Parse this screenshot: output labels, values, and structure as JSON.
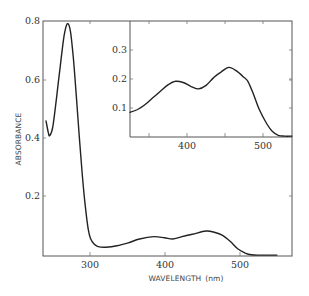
{
  "chart_data": [
    {
      "id": "main",
      "type": "line",
      "title": "",
      "xlabel": "WAVELENGTH (nm)",
      "ylabel": "ABSORBANCE",
      "xlim": [
        237,
        567
      ],
      "ylim": [
        0.0,
        0.8
      ],
      "xticks": [
        300,
        400,
        500
      ],
      "yticks": [
        0.2,
        0.4,
        0.6,
        0.8
      ],
      "ytick_labels": [
        "0.2",
        "0.4",
        "0.6",
        "0.8"
      ],
      "xtick_labels": [
        "300",
        "400",
        "500"
      ],
      "grid": false,
      "series": [
        {
          "name": "absorption spectrum",
          "x": [
            241,
            244,
            246,
            250,
            255,
            260,
            265,
            269,
            273,
            277,
            281,
            285,
            289,
            293,
            297,
            300,
            305,
            310,
            320,
            335,
            350,
            365,
            384,
            398,
            409,
            420,
            435,
            453,
            465,
            475,
            485,
            495,
            505,
            513,
            525,
            547
          ],
          "y": [
            0.46,
            0.42,
            0.41,
            0.44,
            0.54,
            0.65,
            0.75,
            0.79,
            0.77,
            0.68,
            0.55,
            0.41,
            0.28,
            0.17,
            0.09,
            0.06,
            0.04,
            0.032,
            0.03,
            0.035,
            0.045,
            0.058,
            0.066,
            0.062,
            0.058,
            0.065,
            0.074,
            0.085,
            0.08,
            0.07,
            0.05,
            0.025,
            0.01,
            0.004,
            0.003,
            0.003
          ]
        }
      ]
    },
    {
      "id": "inset",
      "type": "line",
      "title": "",
      "xlabel": "",
      "ylabel": "",
      "xlim": [
        325,
        538
      ],
      "ylim": [
        0.0,
        0.4
      ],
      "xticks": [
        350,
        400,
        450,
        500
      ],
      "xtick_labels": [
        "",
        "400",
        "",
        "500"
      ],
      "yticks": [
        0.1,
        0.2,
        0.3
      ],
      "ytick_labels": [
        "0.1",
        "0.2",
        "0.3"
      ],
      "grid": false,
      "series": [
        {
          "name": "absorption spectrum (expanded)",
          "x": [
            325,
            335,
            345,
            355,
            365,
            375,
            385,
            395,
            405,
            415,
            425,
            435,
            445,
            455,
            465,
            475,
            480,
            487,
            495,
            505,
            512,
            520,
            528,
            538
          ],
          "y": [
            0.085,
            0.095,
            0.112,
            0.135,
            0.158,
            0.18,
            0.192,
            0.188,
            0.175,
            0.166,
            0.178,
            0.205,
            0.225,
            0.24,
            0.228,
            0.205,
            0.192,
            0.15,
            0.095,
            0.045,
            0.02,
            0.006,
            0.003,
            0.003
          ]
        }
      ]
    }
  ],
  "labels": {
    "ylabel": "ABSORBANCE",
    "xlabel": "WAVELENGTH (nm)",
    "main_yticks": [
      "0.8",
      "0.6",
      "0.4",
      "0.2"
    ],
    "main_xticks": [
      "300",
      "400",
      "500"
    ],
    "inset_yticks": [
      "0.3",
      "0.2",
      "0.1"
    ],
    "inset_xticks": [
      "400",
      "500"
    ]
  },
  "colors": {
    "curve": "#222222",
    "frame": "#555555",
    "text": "#333333"
  }
}
